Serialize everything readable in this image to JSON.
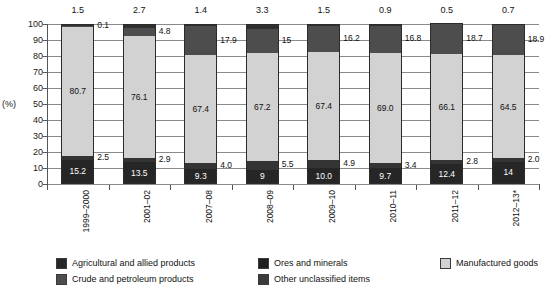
{
  "chart_data": {
    "type": "bar",
    "subtype": "100% stacked column",
    "title": "",
    "xlabel": "",
    "ylabel": "(%)",
    "ylim": [
      0,
      100
    ],
    "yticks": [
      0,
      10,
      20,
      30,
      40,
      50,
      60,
      70,
      80,
      90,
      100
    ],
    "grid": true,
    "legend_position": "bottom",
    "categories": [
      "1999–2000",
      "2001–02",
      "2007–08",
      "2008–09",
      "2009–10",
      "2010–11",
      "2011–12",
      "2012–13*"
    ],
    "series": [
      {
        "name": "Agricultural and allied products",
        "color": "#262626",
        "values": [
          15.2,
          13.5,
          9.3,
          9,
          10.0,
          9.7,
          12.4,
          14
        ],
        "labels": [
          "15.2",
          "13.5",
          "9.3",
          "9",
          "10.0",
          "9.7",
          "12.4",
          "14"
        ]
      },
      {
        "name": "Ores and minerals",
        "color": "#343434",
        "values": [
          2.5,
          2.9,
          4.0,
          5.5,
          4.9,
          3.4,
          2.8,
          2.0
        ],
        "labels": [
          "2.5",
          "2.9",
          "4.0",
          "5.5",
          "4.9",
          "3.4",
          "2.8",
          "2.0"
        ]
      },
      {
        "name": "Manufactured goods",
        "color": "#d2d2d2",
        "values": [
          80.7,
          76.1,
          67.4,
          67.2,
          67.4,
          69.0,
          66.1,
          64.5
        ],
        "labels": [
          "80.7",
          "76.1",
          "67.4",
          "67.2",
          "67.4",
          "69.0",
          "66.1",
          "64.5"
        ]
      },
      {
        "name": "Crude and petroleum products",
        "color": "#4d4d4d",
        "values": [
          0.1,
          4.8,
          17.9,
          15,
          16.2,
          16.8,
          18.7,
          18.9
        ],
        "labels": [
          "0.1",
          "4.8",
          "17.9",
          "15",
          "16.2",
          "16.8",
          "18.7",
          "18.9"
        ]
      },
      {
        "name": "Other unclassified items",
        "color": "#303030",
        "values": [
          1.5,
          2.7,
          1.4,
          3.3,
          1.5,
          0.9,
          0.5,
          0.7
        ],
        "labels": [
          "1.5",
          "2.7",
          "1.4",
          "3.3",
          "1.5",
          "0.9",
          "0.5",
          "0.7"
        ]
      }
    ]
  },
  "axis": {
    "y_title": "(%)",
    "y_ticks": [
      "100",
      "90",
      "80",
      "70",
      "60",
      "50",
      "40",
      "30",
      "20",
      "10",
      "0"
    ]
  },
  "legend": {
    "items": [
      {
        "label": "Agricultural and allied products",
        "color": "#262626"
      },
      {
        "label": "Crude and petroleum products",
        "color": "#4d4d4d"
      },
      {
        "label": "Ores and minerals",
        "color": "#1f1f1f"
      },
      {
        "label": "Other unclassified items",
        "color": "#3a3a3a"
      },
      {
        "label": "Manufactured goods",
        "color": "#d2d2d2"
      }
    ]
  }
}
